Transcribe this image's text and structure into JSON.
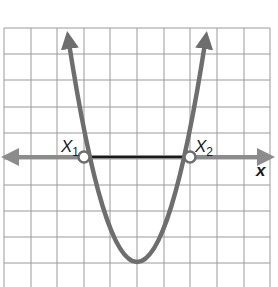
{
  "figure": {
    "type": "parabola-graph",
    "labels": {
      "root1": "X",
      "root1_sub": "1",
      "root2": "X",
      "root2_sub": "2",
      "x_axis": "x"
    },
    "grid": {
      "columns": 10,
      "rows": 10,
      "cell_px": 26.6,
      "line_color": "#9a9a9a"
    },
    "colors": {
      "curve": "#6e6e6e",
      "axis": "#8c8c8c",
      "segment": "#1a1a1a",
      "point_fill": "#ffffff",
      "point_stroke": "#6e6e6e"
    },
    "geometry_units": {
      "root1_x": -2,
      "root2_x": 2,
      "vertex": [
        0,
        -4
      ],
      "equation": "y = x^2 - 4"
    }
  }
}
